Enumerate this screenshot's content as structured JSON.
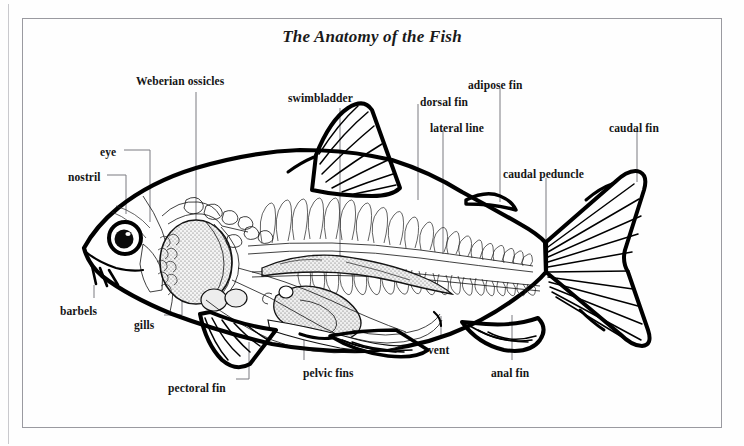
{
  "plate": {
    "title": "The Anatomy of the Fish",
    "background_color": "#fefefe",
    "frame_color": "#9a9aa0",
    "ink_color": "#000000",
    "leader_color": "#7a7a80"
  },
  "labels": [
    {
      "id": "weberian-ossicles",
      "text": "Weberian ossicles",
      "x": 136,
      "y": 75
    },
    {
      "id": "swimbladder",
      "text": "swimbladder",
      "x": 288,
      "y": 92
    },
    {
      "id": "dorsal-fin",
      "text": "dorsal fin",
      "x": 420,
      "y": 96
    },
    {
      "id": "adipose-fin",
      "text": "adipose fin",
      "x": 468,
      "y": 79
    },
    {
      "id": "lateral-line",
      "text": "lateral line",
      "x": 430,
      "y": 122
    },
    {
      "id": "caudal-peduncle",
      "text": "caudal peduncle",
      "x": 503,
      "y": 168
    },
    {
      "id": "caudal-fin",
      "text": "caudal fin",
      "x": 609,
      "y": 122
    },
    {
      "id": "eye",
      "text": "eye",
      "x": 100,
      "y": 146
    },
    {
      "id": "nostril",
      "text": "nostril",
      "x": 68,
      "y": 171
    },
    {
      "id": "barbels",
      "text": "barbels",
      "x": 60,
      "y": 305
    },
    {
      "id": "gills",
      "text": "gills",
      "x": 134,
      "y": 319
    },
    {
      "id": "pectoral-fin",
      "text": "pectoral fin",
      "x": 168,
      "y": 382
    },
    {
      "id": "pelvic-fins",
      "text": "pelvic fins",
      "x": 303,
      "y": 367
    },
    {
      "id": "vent",
      "text": "vent",
      "x": 428,
      "y": 344
    },
    {
      "id": "anal-fin",
      "text": "anal fin",
      "x": 491,
      "y": 367
    }
  ],
  "anatomy_parts": [
    "Weberian ossicles",
    "swimbladder",
    "dorsal fin",
    "adipose fin",
    "lateral line",
    "caudal peduncle",
    "caudal fin",
    "eye",
    "nostril",
    "barbels",
    "gills",
    "pectoral fin",
    "pelvic fins",
    "vent",
    "anal fin"
  ]
}
